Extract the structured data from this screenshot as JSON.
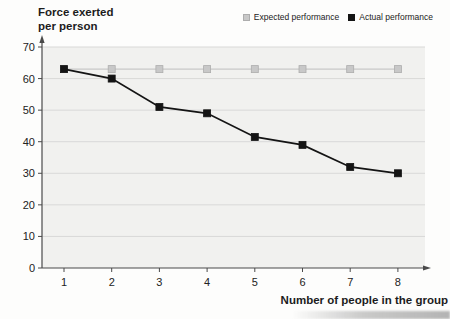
{
  "title": "Force exerted\nper person",
  "legend": [
    {
      "label": "Expected performance",
      "color": "#c8c8c8"
    },
    {
      "label": "Actual performance",
      "color": "#141414"
    }
  ],
  "chart_data": {
    "type": "line",
    "title": "Force exerted per person",
    "xlabel": "Number of people in the group",
    "ylabel": "Force exerted per person",
    "categories": [
      1,
      2,
      3,
      4,
      5,
      6,
      7,
      8
    ],
    "series": [
      {
        "name": "Expected performance",
        "values": [
          63,
          63,
          63,
          63,
          63,
          63,
          63,
          63
        ],
        "color": "#c8c8c8",
        "edge": "#adadad",
        "line_width": 1.2,
        "marker": "square"
      },
      {
        "name": "Actual performance",
        "values": [
          63,
          60,
          51,
          49,
          41.5,
          39,
          32,
          30
        ],
        "color": "#141414",
        "edge": "#141414",
        "line_width": 1.8,
        "marker": "square"
      }
    ],
    "ylim": [
      0,
      70
    ],
    "y_ticks": [
      0,
      10,
      20,
      30,
      40,
      50,
      60,
      70
    ],
    "grid": true,
    "legend_position": "top-right",
    "plot_bg": "#f1f1ef",
    "grid_color": "#d9d9d8",
    "axis_color": "#4a4a4a"
  }
}
